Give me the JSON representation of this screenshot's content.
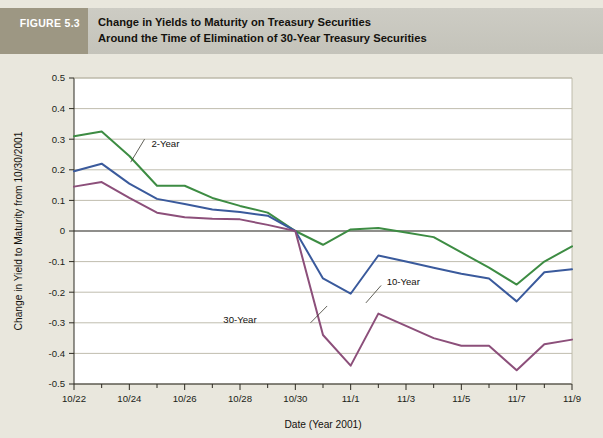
{
  "figure": {
    "tag": "FIGURE 5.3",
    "title_line1": "Change in Yields to Maturity on Treasury Securities",
    "title_line2": "Around the Time of Elimination of 30-Year Treasury Securities"
  },
  "colors": {
    "page_background": "#e9e7dd",
    "banner_tag_background": "#9d9783",
    "banner_title_background": "#c8c7c0",
    "plot_background": "#ffffff",
    "gridline": "#b9b6a5",
    "axis": "#2d2a22",
    "series_2_year": "#3d8c43",
    "series_10_year": "#3a5a9c",
    "series_30_year": "#8c4f7a"
  },
  "chart_data": {
    "type": "line",
    "title": "Change in Yields to Maturity on Treasury Securities Around the Time of Elimination of 30-Year Treasury Securities",
    "xlabel": "Date (Year 2001)",
    "ylabel": "Change in Yield to Maturity from 10/30/2001",
    "grid": true,
    "legend": "inline-annotations",
    "xlim": [
      0,
      18
    ],
    "ylim": [
      -0.5,
      0.5
    ],
    "ytick_labels": [
      "0.5",
      "0.4",
      "0.3",
      "0.2",
      "0.1",
      "0",
      "-0.1",
      "-0.2",
      "-0.3",
      "-0.4",
      "-0.5"
    ],
    "ytick_values": [
      0.5,
      0.4,
      0.3,
      0.2,
      0.1,
      0,
      -0.1,
      -0.2,
      -0.3,
      -0.4,
      -0.5
    ],
    "xtick_labels": [
      "10/22",
      "10/24",
      "10/26",
      "10/28",
      "10/30",
      "11/1",
      "11/3",
      "11/5",
      "11/7",
      "11/9"
    ],
    "xtick_values": [
      0,
      2,
      4,
      6,
      8,
      10,
      12,
      14,
      16,
      18
    ],
    "x": [
      0,
      1,
      2,
      3,
      4,
      5,
      6,
      7,
      8,
      9,
      10,
      11,
      12,
      13,
      14,
      15,
      16,
      17,
      18
    ],
    "x_dates": [
      "10/22",
      "10/23",
      "10/24",
      "10/25",
      "10/26",
      "10/27",
      "10/28",
      "10/29",
      "10/30",
      "10/31",
      "11/1",
      "11/2",
      "11/3",
      "11/4",
      "11/5",
      "11/6",
      "11/7",
      "11/8",
      "11/9"
    ],
    "series": [
      {
        "name": "2-Year",
        "color": "#3d8c43",
        "label": "2-Year",
        "values": [
          0.31,
          0.325,
          0.245,
          0.148,
          0.148,
          0.108,
          0.082,
          0.06,
          0.0,
          -0.045,
          0.005,
          0.01,
          -0.005,
          -0.02,
          -0.07,
          -0.12,
          -0.175,
          -0.1,
          -0.05
        ]
      },
      {
        "name": "10-Year",
        "color": "#3a5a9c",
        "label": "10-Year",
        "values": [
          0.195,
          0.22,
          0.155,
          0.105,
          0.088,
          0.07,
          0.062,
          0.05,
          0.0,
          -0.155,
          -0.205,
          -0.08,
          -0.1,
          -0.12,
          -0.14,
          -0.155,
          -0.23,
          -0.135,
          -0.125
        ]
      },
      {
        "name": "30-Year",
        "color": "#8c4f7a",
        "label": "30-Year",
        "values": [
          0.145,
          0.16,
          0.108,
          0.06,
          0.045,
          0.04,
          0.038,
          0.02,
          0.0,
          -0.34,
          -0.44,
          -0.27,
          -0.31,
          -0.35,
          -0.375,
          -0.375,
          -0.455,
          -0.37,
          -0.355
        ]
      }
    ],
    "annotations": [
      {
        "text": "2-Year",
        "x": 2.8,
        "y": 0.285
      },
      {
        "text": "10-Year",
        "x": 11.3,
        "y": -0.165
      },
      {
        "text": "30-Year",
        "x": 6.6,
        "y": -0.29
      }
    ]
  }
}
